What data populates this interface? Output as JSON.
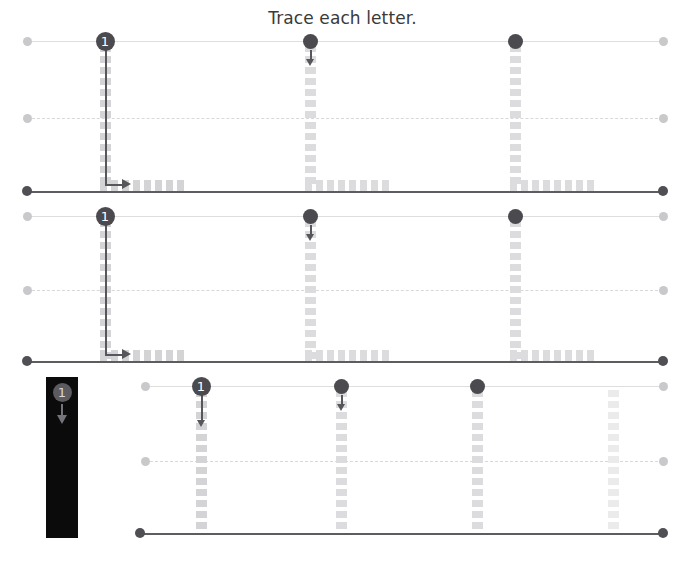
{
  "worksheet": {
    "title": "Trace each letter.",
    "letter": "L",
    "canvas": {
      "width": 685,
      "height": 561
    },
    "colors": {
      "background": "#ffffff",
      "title_text": "#3a3a3a",
      "top_line": "#dededf",
      "mid_line_dashed": "#d8d8da",
      "baseline": "#5d5d61",
      "endpoint_dot_light": "#c9c9cc",
      "endpoint_dot_dark": "#4f4f54",
      "trace_dash_strong": "#d4d4d6",
      "trace_dash_mid": "#dcdcde",
      "trace_dash_faint": "#ebebec",
      "stroke_path": "#56565b",
      "start_marker": "#4a4a4f",
      "start_marker_text": "#ffffff",
      "demo_panel_background": "#0b0b0c",
      "demo_marker": "#5c5c60",
      "demo_marker_text": "#d8d8da",
      "demo_arrow": "#74747a"
    },
    "rows": [
      {
        "id": "row-1",
        "letter_form": "L",
        "guides": {
          "top": {
            "y": 41,
            "x_start": 27,
            "x_end": 663,
            "style": "solid",
            "tone": "light"
          },
          "mid": {
            "y": 118,
            "x_start": 27,
            "x_end": 663,
            "style": "dashed",
            "tone": "light"
          },
          "base": {
            "y": 191,
            "x_start": 27,
            "x_end": 663,
            "style": "solid",
            "tone": "dark"
          }
        },
        "letters": [
          {
            "id": "row1-letter-1",
            "stem_x": 105,
            "foot_x_end": 192,
            "dash_tone": "strong",
            "start_marker": {
              "type": "numbered",
              "label": "1"
            },
            "stroke_path": true,
            "dir_arrow": false
          },
          {
            "id": "row1-letter-2",
            "stem_x": 310,
            "foot_x_end": 397,
            "dash_tone": "mid",
            "start_marker": {
              "type": "dot",
              "label": ""
            },
            "stroke_path": false,
            "dir_arrow": true
          },
          {
            "id": "row1-letter-3",
            "stem_x": 515,
            "foot_x_end": 595,
            "dash_tone": "mid",
            "start_marker": {
              "type": "dot",
              "label": ""
            },
            "stroke_path": false,
            "dir_arrow": false
          }
        ]
      },
      {
        "id": "row-2",
        "letter_form": "L",
        "guides": {
          "top": {
            "y": 216,
            "x_start": 27,
            "x_end": 663,
            "style": "solid",
            "tone": "light"
          },
          "mid": {
            "y": 290,
            "x_start": 27,
            "x_end": 663,
            "style": "dashed",
            "tone": "light"
          },
          "base": {
            "y": 361,
            "x_start": 27,
            "x_end": 663,
            "style": "solid",
            "tone": "dark"
          }
        },
        "letters": [
          {
            "id": "row2-letter-1",
            "stem_x": 105,
            "foot_x_end": 192,
            "dash_tone": "strong",
            "start_marker": {
              "type": "numbered",
              "label": "1"
            },
            "stroke_path": true,
            "dir_arrow": false
          },
          {
            "id": "row2-letter-2",
            "stem_x": 310,
            "foot_x_end": 397,
            "dash_tone": "mid",
            "start_marker": {
              "type": "dot",
              "label": ""
            },
            "stroke_path": false,
            "dir_arrow": true
          },
          {
            "id": "row2-letter-3",
            "stem_x": 515,
            "foot_x_end": 595,
            "dash_tone": "mid",
            "start_marker": {
              "type": "dot",
              "label": ""
            },
            "stroke_path": false,
            "dir_arrow": false
          }
        ]
      },
      {
        "id": "row-3",
        "letter_form": "I",
        "guides": {
          "top": {
            "y": 386,
            "x_start": 145,
            "x_end": 663,
            "style": "solid",
            "tone": "light"
          },
          "mid": {
            "y": 461,
            "x_start": 145,
            "x_end": 663,
            "style": "dashed",
            "tone": "light"
          },
          "base": {
            "y": 533,
            "x_start": 140,
            "x_end": 663,
            "style": "solid",
            "tone": "dark"
          }
        },
        "letters": [
          {
            "id": "row3-letter-1",
            "stem_x": 201,
            "dash_tone": "strong",
            "start_marker": {
              "type": "numbered",
              "label": "1"
            },
            "stroke_path": false,
            "dir_arrow": true,
            "dir_arrow_long": true
          },
          {
            "id": "row3-letter-2",
            "stem_x": 341,
            "dash_tone": "mid",
            "start_marker": {
              "type": "dot",
              "label": ""
            },
            "stroke_path": false,
            "dir_arrow": true
          },
          {
            "id": "row3-letter-3",
            "stem_x": 477,
            "dash_tone": "mid",
            "start_marker": {
              "type": "dot",
              "label": ""
            },
            "stroke_path": false,
            "dir_arrow": false
          },
          {
            "id": "row3-letter-4",
            "stem_x": 613,
            "dash_tone": "faint",
            "start_marker": {
              "type": "none",
              "label": ""
            },
            "stroke_path": false,
            "dir_arrow": false
          }
        ]
      }
    ],
    "demo_panel": {
      "id": "demo-panel",
      "x": 46,
      "y": 377,
      "width": 32,
      "height": 161,
      "marker_label": "1",
      "arrow_direction": "down"
    }
  }
}
